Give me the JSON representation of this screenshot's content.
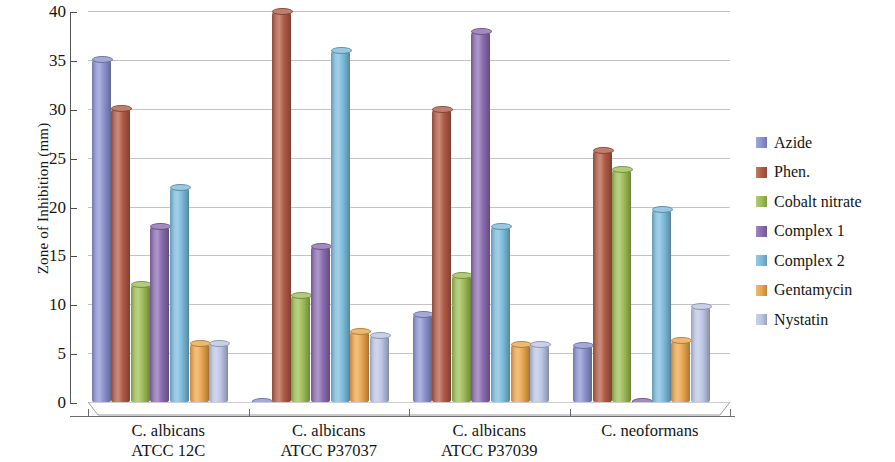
{
  "chart_data": {
    "type": "bar",
    "title": "",
    "xlabel": "",
    "ylabel": "Zone of Inhibition (mm)",
    "ylim": [
      0,
      40
    ],
    "ytick_step": 5,
    "yticks": [
      40,
      35,
      30,
      25,
      20,
      15,
      10,
      5,
      0
    ],
    "grid": true,
    "legend_position": "right",
    "categories": [
      "C. albicans\nATCC 12C",
      "C. albicans\nATCC P37037",
      "C. albicans\nATCC P37039",
      "C. neoformans"
    ],
    "category_lines": [
      [
        "C. albicans",
        "ATCC 12C"
      ],
      [
        "C. albicans",
        "ATCC P37037"
      ],
      [
        "C. albicans",
        "ATCC P37039"
      ],
      [
        "C. neoformans",
        ""
      ]
    ],
    "series": [
      {
        "name": "Azide",
        "color": "#8b92cf",
        "values": [
          35.3,
          0.3,
          9.2,
          6.0
        ]
      },
      {
        "name": "Phen.",
        "color": "#b05b45",
        "values": [
          30.3,
          40.2,
          30.2,
          26.0
        ]
      },
      {
        "name": "Cobalt nitrate",
        "color": "#9dbd55",
        "values": [
          12.3,
          11.2,
          13.2,
          24.0
        ]
      },
      {
        "name": "Complex 1",
        "color": "#8a6cb0",
        "values": [
          18.2,
          16.2,
          38.2,
          0.3
        ]
      },
      {
        "name": "Complex 2",
        "color": "#7cbbdc",
        "values": [
          22.2,
          36.2,
          18.2,
          20.0
        ]
      },
      {
        "name": "Gentamycin",
        "color": "#e9a64c",
        "values": [
          6.2,
          7.5,
          6.1,
          6.6
        ]
      },
      {
        "name": "Nystatin",
        "color": "#bbc5e4",
        "values": [
          6.2,
          7.1,
          6.1,
          10.0
        ]
      }
    ]
  }
}
